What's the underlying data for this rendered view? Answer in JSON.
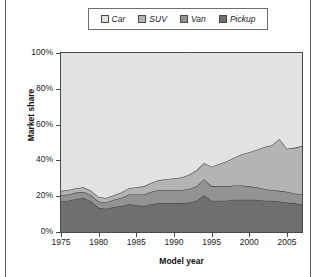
{
  "legend": {
    "items": [
      {
        "label": "Car",
        "color": "#e2e2e2",
        "icon": "legend-swatch-car"
      },
      {
        "label": "SUV",
        "color": "#b4b4b4",
        "icon": "legend-swatch-suv"
      },
      {
        "label": "Van",
        "color": "#939393",
        "icon": "legend-swatch-van"
      },
      {
        "label": "Pickup",
        "color": "#6f6f6f",
        "icon": "legend-swatch-pickup"
      }
    ]
  },
  "chart_data": {
    "type": "area",
    "stacked": true,
    "title": "",
    "xlabel": "Model year",
    "ylabel": "Market share",
    "xlim": [
      1975,
      2007
    ],
    "ylim": [
      0,
      100
    ],
    "xticks": [
      1975,
      1980,
      1985,
      1990,
      1995,
      2000,
      2005
    ],
    "yticks": [
      0,
      20,
      40,
      60,
      80,
      100
    ],
    "ytick_labels": [
      "0%",
      "20%",
      "40%",
      "60%",
      "80%",
      "100%"
    ],
    "grid": false,
    "legend_position": "top-center",
    "plot_background": "#e2e2e2",
    "x": [
      1975,
      1976,
      1977,
      1978,
      1979,
      1980,
      1981,
      1982,
      1983,
      1984,
      1985,
      1986,
      1987,
      1988,
      1989,
      1990,
      1991,
      1992,
      1993,
      1994,
      1995,
      1996,
      1997,
      1998,
      1999,
      2000,
      2001,
      2002,
      2003,
      2004,
      2005,
      2006,
      2007
    ],
    "series": [
      {
        "name": "Pickup",
        "color": "#6f6f6f",
        "values": [
          17.0,
          17.5,
          18.5,
          19.0,
          17.0,
          13.5,
          13.0,
          14.0,
          14.5,
          15.5,
          15.0,
          14.5,
          15.5,
          16.0,
          16.0,
          16.0,
          16.0,
          16.5,
          17.5,
          20.5,
          17.5,
          17.5,
          17.5,
          18.0,
          18.0,
          18.0,
          18.0,
          17.5,
          17.5,
          17.0,
          16.5,
          16.0,
          15.5
        ]
      },
      {
        "name": "Van",
        "color": "#939393",
        "values": [
          3.5,
          3.5,
          3.5,
          3.5,
          3.5,
          3.5,
          3.5,
          4.0,
          4.5,
          5.5,
          6.0,
          6.5,
          7.0,
          7.5,
          7.5,
          7.5,
          7.5,
          7.5,
          8.0,
          9.0,
          8.0,
          8.0,
          8.0,
          8.0,
          8.0,
          7.5,
          7.0,
          6.5,
          6.0,
          6.0,
          6.0,
          5.5,
          5.5
        ]
      },
      {
        "name": "SUV",
        "color": "#b4b4b4",
        "values": [
          2.5,
          2.5,
          2.5,
          2.5,
          2.5,
          2.5,
          2.5,
          2.5,
          3.0,
          3.5,
          4.0,
          4.5,
          5.0,
          5.5,
          6.0,
          6.5,
          7.0,
          8.0,
          9.0,
          9.0,
          11.0,
          12.5,
          14.0,
          15.5,
          17.5,
          19.0,
          21.0,
          23.5,
          25.0,
          29.0,
          24.0,
          25.5,
          27.0
        ]
      },
      {
        "name": "Car",
        "color": "#e2e2e2",
        "values": [
          77.0,
          76.5,
          75.5,
          75.0,
          77.0,
          80.5,
          81.0,
          79.5,
          78.0,
          75.5,
          75.0,
          74.5,
          72.5,
          71.0,
          70.5,
          70.0,
          69.5,
          67.5,
          65.5,
          61.5,
          63.5,
          62.0,
          60.5,
          58.5,
          56.5,
          55.5,
          54.0,
          52.5,
          51.5,
          48.0,
          53.5,
          53.0,
          52.0
        ]
      }
    ]
  }
}
